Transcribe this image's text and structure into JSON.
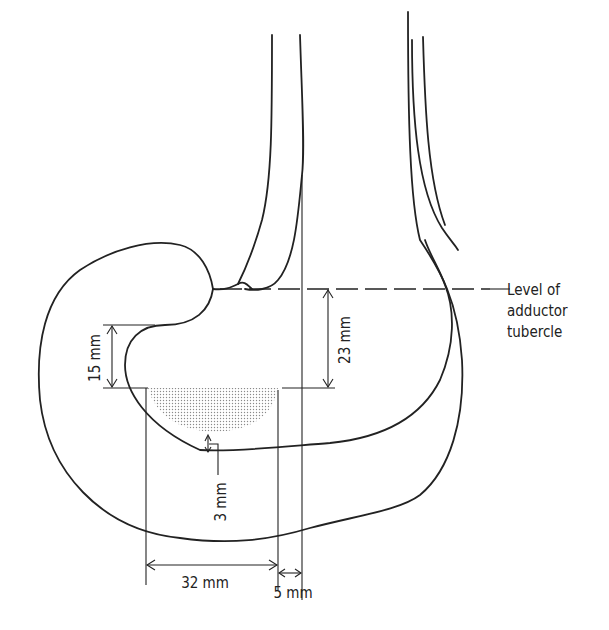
{
  "diagram": {
    "labels": {
      "level_line": [
        "Level of",
        "adductor",
        "tubercle"
      ],
      "dim_15": "15 mm",
      "dim_23": "23 mm",
      "dim_3": "3 mm",
      "dim_32": "32 mm",
      "dim_5": "5 mm"
    },
    "colors": {
      "line": "#222222",
      "shading": "#b8b8b8",
      "background": "#ffffff"
    }
  }
}
